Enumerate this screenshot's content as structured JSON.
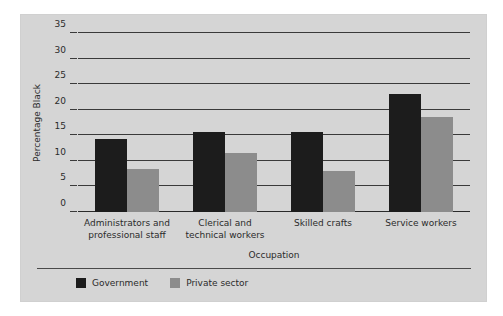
{
  "chart_data": {
    "type": "bar",
    "title": "",
    "xlabel": "Occupation",
    "ylabel": "Percentage Black",
    "categories": [
      "Administrators and professional staff",
      "Clerical and technical workers",
      "Skilled crafts",
      "Service workers"
    ],
    "series": [
      {
        "name": "Government",
        "color": "#1c1c1c",
        "values": [
          14.2,
          15.6,
          15.6,
          23.0
        ]
      },
      {
        "name": "Private sector",
        "color": "#8c8c8c",
        "values": [
          8.4,
          11.6,
          8.0,
          18.5
        ]
      }
    ],
    "ylim": [
      0,
      35
    ],
    "yticks": [
      0,
      5,
      10,
      15,
      20,
      25,
      30,
      35
    ],
    "ytick_labels": [
      "0",
      "5",
      "10",
      "15",
      "20",
      "25",
      "30",
      "35"
    ],
    "grid": true,
    "legend_position": "bottom-left"
  },
  "figure": {
    "background": "#d5d5d5",
    "page_background": "#ffffff"
  }
}
